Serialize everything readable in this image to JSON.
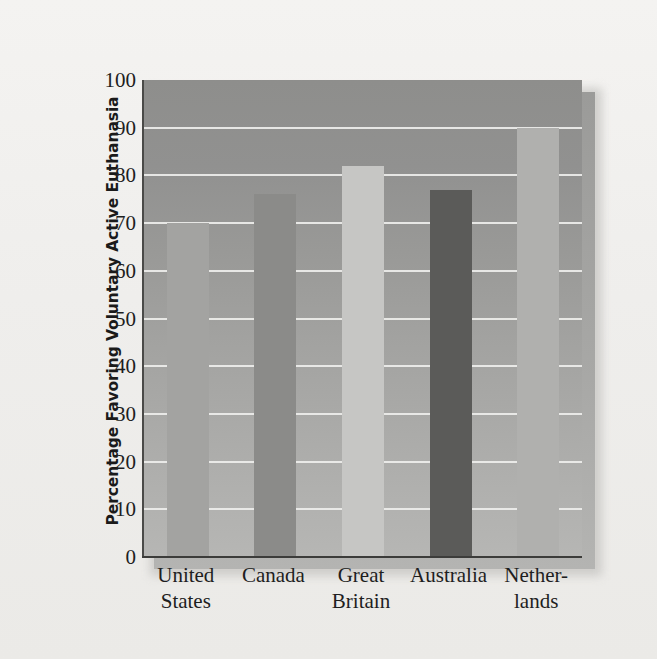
{
  "chart_data": {
    "type": "bar",
    "title": "",
    "xlabel": "",
    "ylabel": "Percentage Favoring Voluntary Active Euthanasia",
    "categories": [
      "United States",
      "Canada",
      "Great Britain",
      "Australia",
      "Netherlands"
    ],
    "category_lines": [
      [
        "United",
        "States"
      ],
      [
        "Canada",
        ""
      ],
      [
        "Great",
        "Britain"
      ],
      [
        "Australia",
        ""
      ],
      [
        "Nether-",
        "lands"
      ]
    ],
    "values": [
      70,
      76,
      82,
      77,
      90
    ],
    "ylim": [
      0,
      100
    ],
    "ytick_labels": [
      "0",
      "10",
      "20",
      "30",
      "40",
      "50",
      "60",
      "70",
      "80",
      "90",
      "100"
    ],
    "ytick_values": [
      0,
      10,
      20,
      30,
      40,
      50,
      60,
      70,
      80,
      90,
      100
    ],
    "grid": true,
    "legend": "none",
    "bar_colors": [
      "#a3a3a1",
      "#8b8b89",
      "#c6c6c4",
      "#5b5b59",
      "#b0b0ae"
    ],
    "plot_background_top": "#8e8e8c",
    "plot_background_bottom": "#b6b6b4",
    "gridline_color": "#eeeeec",
    "axis_color": "#3c3c3a",
    "page_background": "#f2f1ef",
    "text_color": "#1e1e1e"
  }
}
